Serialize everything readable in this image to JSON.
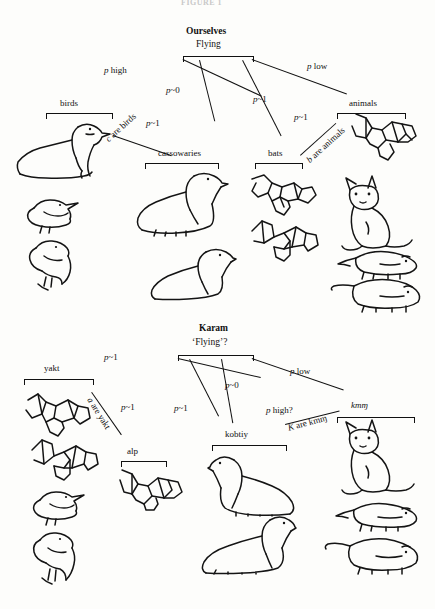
{
  "figure": {
    "caption_top": "FIGURE 1"
  },
  "panels": [
    {
      "id": "ourselves",
      "title": "Ourselves",
      "root": "Flying",
      "edges": [
        {
          "id": "e1",
          "label_p": "p",
          "label_rest": " high"
        },
        {
          "id": "e2",
          "label_p": "p",
          "label_rest": "~0"
        },
        {
          "id": "e3",
          "label_p": "p",
          "label_rest": "~1"
        },
        {
          "id": "e4",
          "label_p": "p",
          "label_rest": " low"
        },
        {
          "id": "e5",
          "label_p": "p",
          "label_rest": "~1"
        },
        {
          "id": "e6",
          "label_p": "p",
          "label_rest": "~1"
        }
      ],
      "categories": [
        {
          "id": "birds",
          "label": "birds"
        },
        {
          "id": "cassowaries",
          "label": "cassowaries"
        },
        {
          "id": "bats",
          "label": "bats"
        },
        {
          "id": "animals",
          "label": "animals"
        }
      ],
      "relations": [
        {
          "id": "c-are-birds",
          "text_italic": "c",
          "text_rest": " are birds"
        },
        {
          "id": "b-are-animals",
          "text_italic": "b",
          "text_rest": " are animals"
        }
      ]
    },
    {
      "id": "karam",
      "title": "Karam",
      "root": "‘Flying’?",
      "edges": [
        {
          "id": "k1",
          "label_p": "p",
          "label_rest": "~1"
        },
        {
          "id": "k2",
          "label_p": "p",
          "label_rest": "~1"
        },
        {
          "id": "k3",
          "label_p": "p",
          "label_rest": "~1"
        },
        {
          "id": "k4",
          "label_p": "p",
          "label_rest": "~0"
        },
        {
          "id": "k5",
          "label_p": "p",
          "label_rest": " low"
        },
        {
          "id": "k6",
          "label_p": "p",
          "label_rest": " high?"
        }
      ],
      "categories": [
        {
          "id": "yakt",
          "label": "yakt"
        },
        {
          "id": "alp",
          "label": "alp"
        },
        {
          "id": "kobtiy",
          "label": "kobtiy"
        },
        {
          "id": "kmn",
          "label": "kmɱ"
        }
      ],
      "relations": [
        {
          "id": "a-are-yakt",
          "text_italic": "a",
          "text_rest": " are yakt"
        },
        {
          "id": "k-are-kmn",
          "text_italic": "K",
          "text_rest": " are kmɱ"
        }
      ]
    }
  ],
  "artwork": [
    {
      "id": "goose-large",
      "name": "bird-goose-drawing"
    },
    {
      "id": "small-bird",
      "name": "bird-small-drawing"
    },
    {
      "id": "parrot",
      "name": "bird-parrot-drawing"
    },
    {
      "id": "cassowary-upper",
      "name": "cassowary-drawing"
    },
    {
      "id": "cassowary-lower",
      "name": "cassowary-drawing"
    },
    {
      "id": "bat-flying-1",
      "name": "bat-drawing"
    },
    {
      "id": "bat-flying-2",
      "name": "bat-drawing"
    },
    {
      "id": "bat-top-right",
      "name": "bat-drawing"
    },
    {
      "id": "kangaroo",
      "name": "marsupial-kangaroo-drawing"
    },
    {
      "id": "rodent-1",
      "name": "rodent-drawing"
    },
    {
      "id": "rodent-2",
      "name": "rodent-drawing"
    },
    {
      "id": "bat-karam-1",
      "name": "bat-drawing"
    },
    {
      "id": "bat-karam-2",
      "name": "bat-drawing"
    },
    {
      "id": "bat-karam-alp",
      "name": "bat-drawing"
    }
  ]
}
